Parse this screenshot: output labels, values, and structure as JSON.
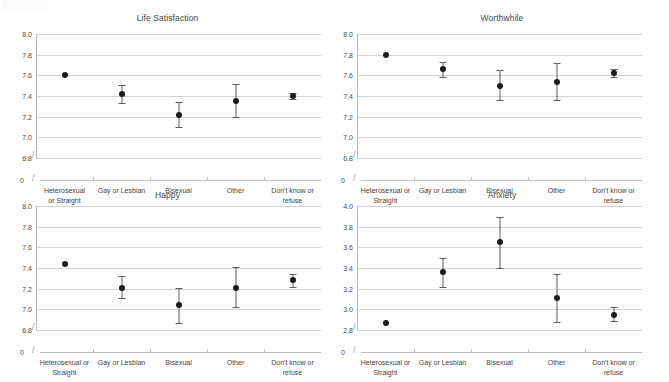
{
  "figure": {
    "background": "#ffffff",
    "point_color": "#1b1b1b",
    "error_bar_color": "#5d5d5d",
    "gridline_color": "#d2d2d2",
    "axis_color": "#b8b8b8"
  },
  "categories": [
    "Heterosexual or Straight",
    "Gay or Lesbian",
    "Bisexual",
    "Other",
    "Don't know or refuse"
  ],
  "category_labels_wrapped": {
    "life_satisfaction": [
      "Heterosexual\nor Straight",
      "Gay or Lesbian",
      "Bisexual",
      "Other",
      "Don't know or\nrefuse"
    ],
    "worthwhile": [
      "Heterosexual or\nStraight",
      "Gay or Lesbian",
      "Bisexual",
      "Other",
      "Don't know or\nrefuse"
    ],
    "happy": [
      "Heterosexual or\nStraight",
      "Gay or Lesbian",
      "Bisexual",
      "Other",
      "Don't know or\nrefuse"
    ],
    "anxiety": [
      "Heterosexual or\nStraight",
      "Gay or Lesbian",
      "Bisexual",
      "Other",
      "Don't know or\nrefuse"
    ]
  },
  "zero_label": "0",
  "chart_data": [
    {
      "id": "life_satisfaction",
      "type": "scatter",
      "title": "Life Satisfaction",
      "xlabel": "",
      "ylabel": "",
      "ylim": [
        6.8,
        8.0
      ],
      "yticks": [
        "8.0",
        "7.8",
        "7.6",
        "7.4",
        "7.2",
        "7.0",
        "6.8"
      ],
      "ytick_values": [
        8.0,
        7.8,
        7.6,
        7.4,
        7.2,
        7.0,
        6.8
      ],
      "grid": true,
      "axis_break": true,
      "legend": "none",
      "categories": [
        "Heterosexual or Straight",
        "Gay or Lesbian",
        "Bisexual",
        "Other",
        "Don't know or refuse"
      ],
      "values": [
        7.6,
        7.42,
        7.22,
        7.35,
        7.4
      ],
      "ci_low": [
        7.6,
        7.33,
        7.1,
        7.2,
        7.37
      ],
      "ci_high": [
        7.6,
        7.51,
        7.34,
        7.52,
        7.43
      ]
    },
    {
      "id": "worthwhile",
      "type": "scatter",
      "title": "Worthwhile",
      "xlabel": "",
      "ylabel": "",
      "ylim": [
        6.8,
        8.0
      ],
      "yticks": [
        "8.0",
        "7.8",
        "7.6",
        "7.4",
        "7.2",
        "7.0",
        "6.8"
      ],
      "ytick_values": [
        8.0,
        7.8,
        7.6,
        7.4,
        7.2,
        7.0,
        6.8
      ],
      "grid": true,
      "axis_break": true,
      "legend": "none",
      "categories": [
        "Heterosexual or Straight",
        "Gay or Lesbian",
        "Bisexual",
        "Other",
        "Don't know or refuse"
      ],
      "values": [
        7.8,
        7.66,
        7.5,
        7.54,
        7.62
      ],
      "ci_low": [
        7.8,
        7.58,
        7.36,
        7.36,
        7.58
      ],
      "ci_high": [
        7.8,
        7.73,
        7.65,
        7.72,
        7.66
      ]
    },
    {
      "id": "happy",
      "type": "scatter",
      "title": "Happy",
      "xlabel": "",
      "ylabel": "",
      "ylim": [
        6.8,
        8.0
      ],
      "yticks": [
        "8.0",
        "7.8",
        "7.6",
        "7.4",
        "7.2",
        "7.0",
        "6.8"
      ],
      "ytick_values": [
        8.0,
        7.8,
        7.6,
        7.4,
        7.2,
        7.0,
        6.8
      ],
      "grid": true,
      "axis_break": true,
      "legend": "none",
      "categories": [
        "Heterosexual or Straight",
        "Gay or Lesbian",
        "Bisexual",
        "Other",
        "Don't know or refuse"
      ],
      "values": [
        7.44,
        7.21,
        7.04,
        7.21,
        7.28
      ],
      "ci_low": [
        7.44,
        7.11,
        6.87,
        7.02,
        7.22
      ],
      "ci_high": [
        7.44,
        7.32,
        7.21,
        7.41,
        7.34
      ]
    },
    {
      "id": "anxiety",
      "type": "scatter",
      "title": "Anxiety",
      "xlabel": "",
      "ylabel": "",
      "ylim": [
        2.8,
        4.0
      ],
      "yticks": [
        "4.0",
        "3.8",
        "3.6",
        "3.4",
        "3.2",
        "3.0",
        "2.8"
      ],
      "ytick_values": [
        4.0,
        3.8,
        3.6,
        3.4,
        3.2,
        3.0,
        2.8
      ],
      "grid": true,
      "axis_break": true,
      "legend": "none",
      "categories": [
        "Heterosexual or Straight",
        "Gay or Lesbian",
        "Bisexual",
        "Other",
        "Don't know or refuse"
      ],
      "values": [
        2.87,
        3.36,
        3.65,
        3.11,
        2.95
      ],
      "ci_low": [
        2.87,
        3.22,
        3.4,
        2.88,
        2.89
      ],
      "ci_high": [
        2.87,
        3.5,
        3.89,
        3.34,
        3.02
      ]
    }
  ]
}
